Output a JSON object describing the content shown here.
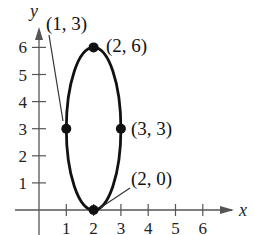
{
  "chart_data": {
    "type": "scatter",
    "title": "",
    "xlabel": "x",
    "ylabel": "y",
    "xlim": [
      0,
      6.5
    ],
    "ylim": [
      0,
      6.5
    ],
    "grid": false,
    "x_ticks": [
      "1",
      "2",
      "3",
      "4",
      "5",
      "6"
    ],
    "y_ticks": [
      "1",
      "2",
      "3",
      "4",
      "5",
      "6"
    ],
    "curve": {
      "shape": "ellipse",
      "center": [
        2,
        3
      ],
      "semi_axis_x": 1,
      "semi_axis_y": 3,
      "color": "#111111"
    },
    "points": [
      {
        "x": 1,
        "y": 3,
        "label": "(1, 3)"
      },
      {
        "x": 2,
        "y": 6,
        "label": "(2, 6)"
      },
      {
        "x": 3,
        "y": 3,
        "label": "(3, 3)"
      },
      {
        "x": 2,
        "y": 0,
        "label": "(2, 0)"
      }
    ]
  }
}
